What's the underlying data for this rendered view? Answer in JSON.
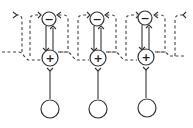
{
  "diagram": {
    "type": "circuit-schematic",
    "units": [
      {
        "inhibitory_label": "−",
        "excitatory_label": "+",
        "cx": 49
      },
      {
        "inhibitory_label": "−",
        "excitatory_label": "+",
        "cx": 97
      },
      {
        "inhibitory_label": "−",
        "excitatory_label": "+",
        "cx": 146
      }
    ],
    "colors": {
      "stroke": "#333333",
      "background": "#ffffff"
    }
  }
}
